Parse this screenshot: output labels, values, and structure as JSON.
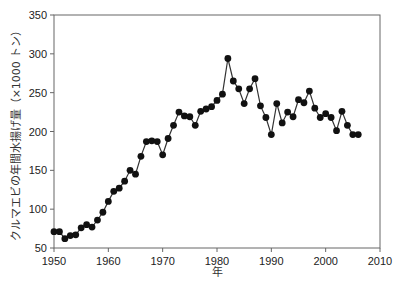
{
  "chart_data": {
    "type": "line",
    "title": "",
    "xlabel": "年",
    "ylabel": "クルマエビの年間水揚げ量（×1000 トン）",
    "xlim": [
      1950,
      2010
    ],
    "ylim": [
      50,
      350
    ],
    "xticks": [
      1950,
      1960,
      1970,
      1980,
      1990,
      2000,
      2010
    ],
    "yticks": [
      50,
      100,
      150,
      200,
      250,
      300,
      350
    ],
    "grid": false,
    "legend": null,
    "marker": "circle",
    "series": [
      {
        "name": "クルマエビの年間水揚げ量",
        "x": [
          1950,
          1951,
          1952,
          1953,
          1954,
          1955,
          1956,
          1957,
          1958,
          1959,
          1960,
          1961,
          1962,
          1963,
          1964,
          1965,
          1966,
          1967,
          1968,
          1969,
          1970,
          1971,
          1972,
          1973,
          1974,
          1975,
          1976,
          1977,
          1978,
          1979,
          1980,
          1981,
          1982,
          1983,
          1984,
          1985,
          1986,
          1987,
          1988,
          1989,
          1990,
          1991,
          1992,
          1993,
          1994,
          1995,
          1996,
          1997,
          1998,
          1999,
          2000,
          2001,
          2002,
          2003,
          2004,
          2005,
          2006
        ],
        "values": [
          71,
          71,
          62,
          66,
          67,
          76,
          80,
          77,
          86,
          96,
          110,
          123,
          127,
          136,
          150,
          145,
          168,
          187,
          188,
          187,
          170,
          191,
          208,
          225,
          220,
          219,
          208,
          226,
          229,
          232,
          240,
          248,
          294,
          265,
          255,
          236,
          255,
          268,
          233,
          218,
          196,
          236,
          211,
          225,
          219,
          241,
          237,
          252,
          230,
          218,
          223,
          218,
          201,
          226,
          208,
          196,
          196
        ]
      }
    ],
    "colors": {
      "line": "#333333",
      "marker": "#111111",
      "axis": "#555555"
    }
  }
}
